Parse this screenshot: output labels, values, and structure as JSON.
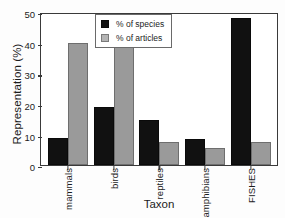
{
  "chart_data": {
    "type": "bar",
    "title": "",
    "xlabel": "Taxon",
    "ylabel": "Representation (%)",
    "categories": [
      "mammals",
      "birds",
      "reptiles",
      "amphibians",
      "FISHES"
    ],
    "series": [
      {
        "name": "% of species",
        "color": "#111111",
        "values": [
          8.7,
          19.0,
          14.8,
          8.5,
          48.0
        ]
      },
      {
        "name": "% of articles",
        "color": "#9a9a9a",
        "values": [
          40.0,
          39.0,
          7.5,
          5.5,
          7.5
        ]
      }
    ],
    "ylim": [
      0,
      50
    ],
    "yticks": [
      0,
      10,
      20,
      30,
      40,
      50
    ],
    "ytick_labels": [
      "0",
      "10",
      "20",
      "30",
      "40",
      "50"
    ],
    "grid": false,
    "legend_position": "top-center",
    "xtick_rotation": 90
  },
  "legend": {
    "items": [
      {
        "label": "% of species"
      },
      {
        "label": "% of articles"
      }
    ]
  }
}
